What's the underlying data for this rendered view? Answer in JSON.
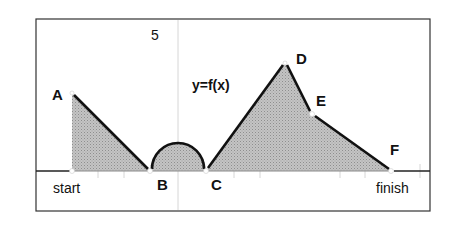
{
  "diagram": {
    "title": "y=f(x)",
    "y_tick_label": "5",
    "x_axis_labels": {
      "start": "start",
      "finish": "finish"
    },
    "points": [
      {
        "name": "A",
        "label": "A"
      },
      {
        "name": "B",
        "label": "B"
      },
      {
        "name": "C",
        "label": "C"
      },
      {
        "name": "D",
        "label": "D"
      },
      {
        "name": "E",
        "label": "E"
      },
      {
        "name": "F",
        "label": "F"
      }
    ],
    "colors": {
      "fill": "#b9b9b9",
      "line": "#111111",
      "frame": "#333333",
      "grid": "#d0d0d0"
    },
    "segments": [
      "start to A: vertical rise",
      "A to B: straight descent",
      "B to C: semicircle above axis",
      "C to D: straight ascent",
      "D to E: straight descent",
      "E to F: straight descent (shallower)",
      "F to finish: on axis"
    ]
  }
}
